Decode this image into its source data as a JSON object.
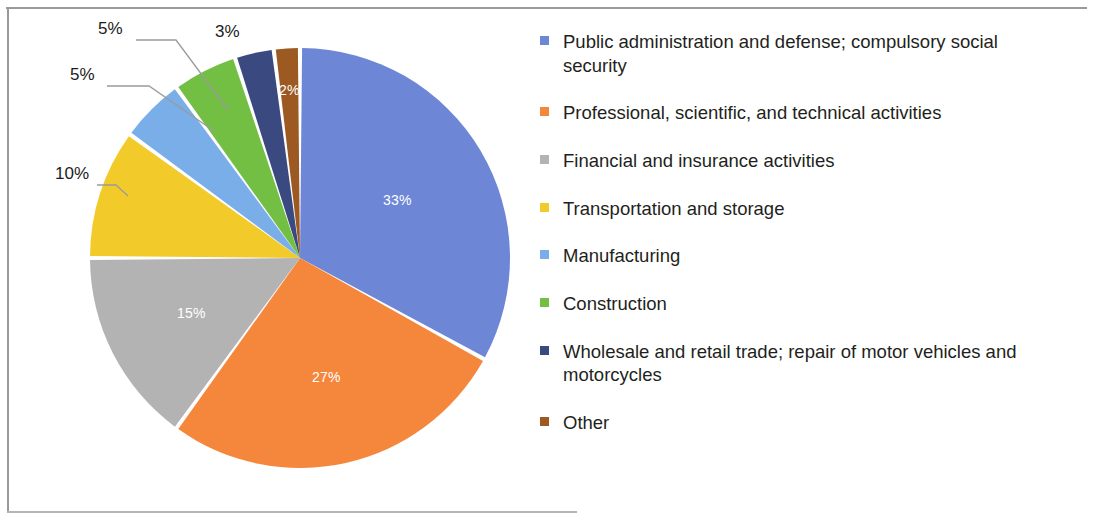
{
  "chart_data": {
    "type": "pie",
    "title": "",
    "subtitle": "",
    "xlabel": "",
    "ylabel": "",
    "legend_position": "right",
    "grid": false,
    "start_angle_deg": 0,
    "direction": "clockwise",
    "value_unit": "percent",
    "categories": [
      "Public administration and defense; compulsory social security",
      "Professional, scientific, and technical activities",
      "Financial and insurance activities",
      "Transportation and storage",
      "Manufacturing",
      "Construction",
      "Wholesale and retail trade; repair of motor vehicles and motorcycles",
      "Other"
    ],
    "values": [
      33,
      27,
      15,
      10,
      5,
      5,
      3,
      2
    ],
    "labels": [
      "33%",
      "27%",
      "15%",
      "10%",
      "5%",
      "5%",
      "3%",
      "2%"
    ],
    "colors": [
      "#6d86d6",
      "#f4873c",
      "#b3b3b3",
      "#f2cb2b",
      "#7aaee8",
      "#72bf44",
      "#3a4a80",
      "#9c5a22"
    ],
    "slices": [
      {
        "name": "Public administration and defense; compulsory social security",
        "value": 33,
        "label": "33%",
        "color": "#6d86d6",
        "label_placement": "inside"
      },
      {
        "name": "Professional, scientific, and technical activities",
        "value": 27,
        "label": "27%",
        "color": "#f4873c",
        "label_placement": "inside"
      },
      {
        "name": "Financial and insurance activities",
        "value": 15,
        "label": "15%",
        "color": "#b3b3b3",
        "label_placement": "inside"
      },
      {
        "name": "Transportation and storage",
        "value": 10,
        "label": "10%",
        "color": "#f2cb2b",
        "label_placement": "outside-leader"
      },
      {
        "name": "Manufacturing",
        "value": 5,
        "label": "5%",
        "color": "#7aaee8",
        "label_placement": "outside-leader"
      },
      {
        "name": "Construction",
        "value": 5,
        "label": "5%",
        "color": "#72bf44",
        "label_placement": "outside-leader"
      },
      {
        "name": "Wholesale and retail trade; repair of motor vehicles and motorcycles",
        "value": 3,
        "label": "3%",
        "color": "#3a4a80",
        "label_placement": "outside"
      },
      {
        "name": "Other",
        "value": 2,
        "label": "2%",
        "color": "#9c5a22",
        "label_placement": "inside"
      }
    ]
  },
  "legend": {
    "items": [
      {
        "label": "Public administration and defense; compulsory social security",
        "color": "#6d86d6"
      },
      {
        "label": "Professional, scientific, and technical activities",
        "color": "#f4873c"
      },
      {
        "label": "Financial and insurance activities",
        "color": "#b3b3b3"
      },
      {
        "label": "Transportation and storage",
        "color": "#f2cb2b"
      },
      {
        "label": "Manufacturing",
        "color": "#7aaee8"
      },
      {
        "label": "Construction",
        "color": "#72bf44"
      },
      {
        "label": "Wholesale and retail trade; repair of motor vehicles and motorcycles",
        "color": "#3a4a80"
      },
      {
        "label": "Other",
        "color": "#9c5a22"
      }
    ]
  }
}
